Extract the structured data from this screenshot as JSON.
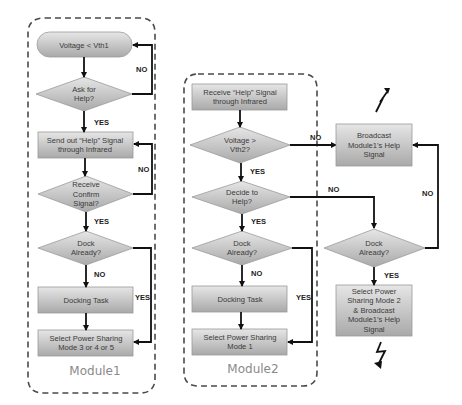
{
  "modules": [
    {
      "label": "Module1"
    },
    {
      "label": "Module2"
    }
  ],
  "nodes": {
    "m1_start": [
      "Voltage < Vth1"
    ],
    "m1_ask": [
      "Ask for",
      "Help?"
    ],
    "m1_send": [
      "Send out “Help” Signal",
      "through Infrared"
    ],
    "m1_confirm": [
      "Receive",
      "Confirm",
      "Signal?"
    ],
    "m1_dock": [
      "Dock",
      "Already?"
    ],
    "m1_docking": [
      "Docking Task"
    ],
    "m1_select": [
      "Select Power Sharing",
      "Mode 3 or 4 or 5"
    ],
    "m2_receive": [
      "Receive “Help” Signal",
      "through Infrared"
    ],
    "m2_voltage": [
      "Voltage >",
      "Vth2?"
    ],
    "m2_decide": [
      "Decide to",
      "Help?"
    ],
    "m2_dock": [
      "Dock",
      "Already?"
    ],
    "m2_docking": [
      "Docking Task"
    ],
    "m2_select": [
      "Select Power Sharing",
      "Mode 1"
    ],
    "broadcast": [
      "Broadcast",
      "Module1’s Help",
      "Signal"
    ],
    "m3_dock": [
      "Dock",
      "Already?"
    ],
    "m3_select": [
      "Select Power",
      "Sharing Mode 2",
      "& Broadcast",
      "Module1’s Help",
      "Signal"
    ]
  },
  "edge_labels": {
    "m1_ask_no": "NO",
    "m1_ask_yes": "YES",
    "m1_confirm_no": "NO",
    "m1_confirm_yes": "YES",
    "m1_dock_no": "NO",
    "m1_dock_yes": "YES",
    "m2_voltage_no": "NO",
    "m2_voltage_yes": "YES",
    "m2_decide_no": "NO",
    "m2_decide_yes": "YES",
    "m2_dock_no": "NO",
    "m2_dock_yes": "YES",
    "m3_dock_no": "NO",
    "m3_dock_yes": "YES"
  },
  "icons": {
    "signal_top": "wireless-signal-icon",
    "signal_bottom": "wireless-signal-icon"
  }
}
